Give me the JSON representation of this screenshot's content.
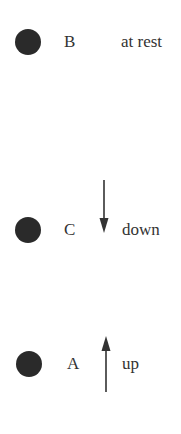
{
  "objects": [
    {
      "name": "B",
      "state": "at rest",
      "direction": "none"
    },
    {
      "name": "C",
      "state": "down",
      "direction": "down"
    },
    {
      "name": "A",
      "state": "up",
      "direction": "up"
    }
  ],
  "colors": {
    "ball": "#2a2a2a",
    "text": "#333333",
    "arrow": "#333333"
  }
}
